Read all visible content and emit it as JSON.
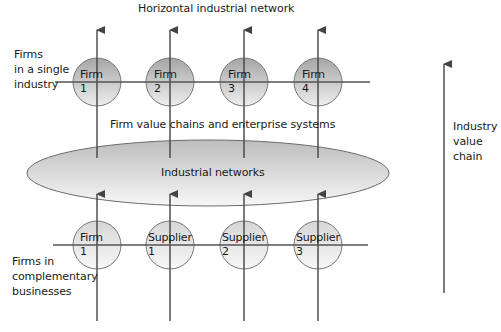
{
  "title": "Horizontal industrial network",
  "labels": {
    "top_group": "Firms\nin a single\nindustry",
    "bottom_group": "Firms in\ncomplementary\nbusinesses",
    "middle_band": "Firm value chains and enterprise systems",
    "ellipse": "Industrial networks",
    "right_axis": "Industry\nvalue\nchain"
  },
  "top_nodes": [
    {
      "label": "Firm\n1"
    },
    {
      "label": "Firm\n2"
    },
    {
      "label": "Firm\n3"
    },
    {
      "label": "Firm\n4"
    }
  ],
  "bottom_nodes": [
    {
      "label": "Firm\n1"
    },
    {
      "label": "Supplier\n1"
    },
    {
      "label": "Supplier\n2"
    },
    {
      "label": "Supplier\n3"
    }
  ],
  "colors": {
    "line": "#555555",
    "top_node_dark": "#a9a9a9",
    "top_node_light": "#ececec",
    "bottom_node_dark": "#d8d8d8",
    "bottom_node_light": "#f7f7f7",
    "ellipse_dark": "#c4c4c4",
    "ellipse_light": "#f6f6f6"
  }
}
